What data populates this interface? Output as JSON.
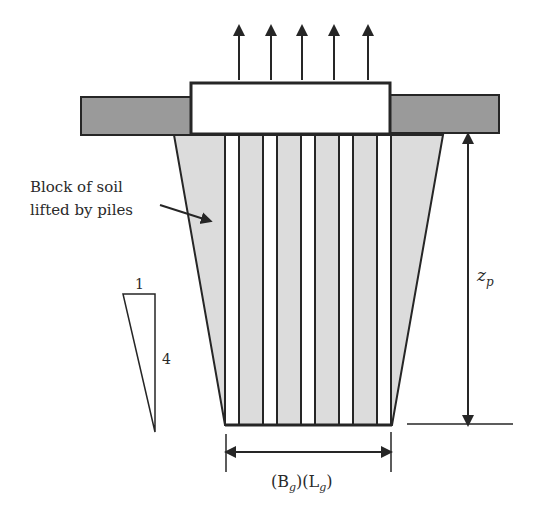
{
  "figure": {
    "type": "pile group uplift diagram",
    "colors": {
      "background": "#ffffff",
      "line": "#262626",
      "pile_cap_fill": "#ffffff",
      "ground_slab_fill": "#9a9a9a",
      "soil_block_fill": "#dcdcdc",
      "pile_fill": "#ffffff"
    },
    "labels": {
      "soil_block_line1": "Block of soil",
      "soil_block_line2": "lifted by piles",
      "slope_horizontal": "1",
      "slope_vertical": "4",
      "depth_symbol": "z",
      "depth_subscript": "p",
      "base_dim_open1": "(B",
      "base_dim_sub1": "g",
      "base_dim_mid": ")(L",
      "base_dim_sub2": "g",
      "base_dim_close": ")"
    },
    "uplift_arrows": {
      "count": 5,
      "x": [
        239,
        271,
        302,
        334,
        368
      ]
    },
    "piles": {
      "count": 5,
      "left_edges": [
        225,
        263,
        301,
        339,
        377
      ],
      "width": 14
    }
  }
}
